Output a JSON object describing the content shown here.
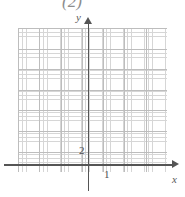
{
  "figure": {
    "caption": "(2)",
    "background_color": "#ffffff",
    "axis_color": "#555555",
    "major_grid_color": "#bdbdbd",
    "minor_grid_color": "#c9c9c9"
  },
  "chart_data": {
    "type": "scatter",
    "title": "(2)",
    "xlabel": "x",
    "ylabel": "y",
    "xlim": [
      -3.5,
      4
    ],
    "ylim": [
      -0.5,
      6.5
    ],
    "grid": true,
    "minor_grid": true,
    "legend": null,
    "series": [],
    "x_tick_labels": [
      "1"
    ],
    "x_tick_values": [
      1
    ],
    "y_tick_labels": [
      "2"
    ],
    "y_tick_values": [
      2
    ],
    "annotations": []
  },
  "axes": {
    "y_name": "y",
    "x_name": "x"
  },
  "ticks": {
    "y_value": "2",
    "x_value": "1"
  }
}
